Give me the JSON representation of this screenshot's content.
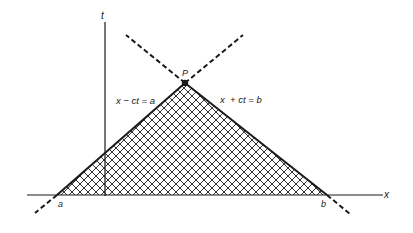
{
  "diagram": {
    "axes": {
      "x_label": "x",
      "t_label": "t"
    },
    "points": {
      "apex_label": "P",
      "left_foot_label": "a",
      "right_foot_label": "b"
    },
    "characteristics": {
      "left_line_label": "x − ct = a",
      "right_line_label": "x  + ct = b"
    },
    "colors": {
      "ink": "#1a1a1a",
      "background": "#ffffff"
    }
  }
}
